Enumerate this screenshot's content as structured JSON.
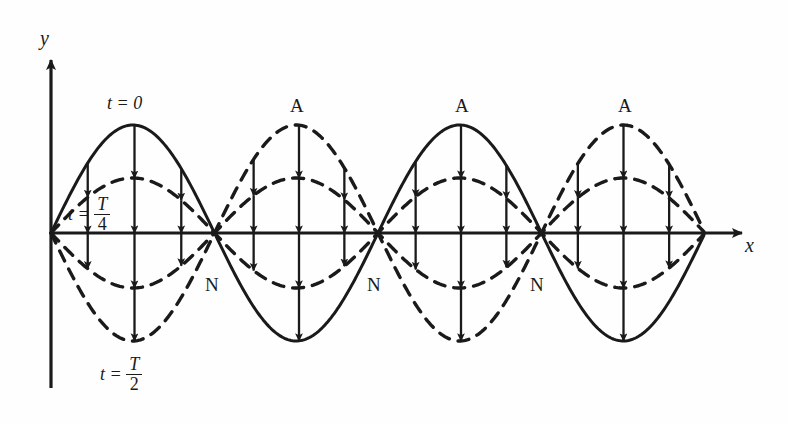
{
  "figure": {
    "type": "standing-wave-diagram",
    "background": "#fefefe",
    "ink": "#1a1a1a",
    "axes": {
      "x_label": "x",
      "y_label": "y",
      "origin": [
        51,
        233
      ],
      "x_axis_end": [
        748,
        233
      ],
      "y_axis_top": [
        51,
        56
      ],
      "y_axis_bottom": [
        51,
        388
      ]
    },
    "labels": {
      "t0": "t = 0",
      "t_quarter_prefix": "t =",
      "t_quarter_num": "T",
      "t_quarter_den": "4",
      "t_half_prefix": "t =",
      "t_half_num": "T",
      "t_half_den": "2",
      "antinode": "A",
      "node": "N"
    },
    "annotations": [
      {
        "name": "antinode-1",
        "text": "A",
        "x": 290,
        "y": 96
      },
      {
        "name": "antinode-2",
        "text": "A",
        "x": 455,
        "y": 96
      },
      {
        "name": "antinode-3",
        "text": "A",
        "x": 618,
        "y": 96
      },
      {
        "name": "node-1",
        "text": "N",
        "x": 205,
        "y": 275
      },
      {
        "name": "node-2",
        "text": "N",
        "x": 367,
        "y": 275
      },
      {
        "name": "node-3",
        "text": "N",
        "x": 530,
        "y": 275
      }
    ],
    "time_labels": [
      {
        "name": "t-zero-label",
        "x": 107,
        "y": 96
      },
      {
        "name": "t-quarter-label",
        "x": 68,
        "y": 195
      },
      {
        "name": "t-half-label",
        "x": 100,
        "y": 355
      }
    ]
  },
  "chart_data": {
    "type": "line",
    "title": "",
    "xlabel": "x",
    "ylabel": "y",
    "grid": false,
    "legend": "inline-annotations",
    "axis_y_px": 233,
    "x_origin_px": 51,
    "node_positions_px": [
      51,
      218,
      380,
      542,
      705
    ],
    "half_wavelength_px": 163.5,
    "wavelength_px": 327,
    "series": [
      {
        "name": "t = 0",
        "style": "solid",
        "amplitude_px": 108,
        "description": "y = A sin(pi x / 163.5), crests at x=133 and x=461, troughs at x=299 and x=623"
      },
      {
        "name": "t = T/4",
        "style": "dashed",
        "amplitude_px": 55,
        "description": "same spatial shape, reduced amplitude, both +/- envelopes drawn"
      },
      {
        "name": "t = T/2",
        "style": "dashed",
        "amplitude_px": 108,
        "description": "inverted profile of t = 0"
      }
    ],
    "velocity_arrows": [
      {
        "lobe": 1,
        "x_range_px": [
          51,
          218
        ],
        "direction": "down"
      },
      {
        "lobe": 2,
        "x_range_px": [
          218,
          380
        ],
        "direction": "up"
      },
      {
        "lobe": 3,
        "x_range_px": [
          380,
          542
        ],
        "direction": "down"
      },
      {
        "lobe": 4,
        "x_range_px": [
          542,
          705
        ],
        "direction": "up"
      }
    ]
  }
}
